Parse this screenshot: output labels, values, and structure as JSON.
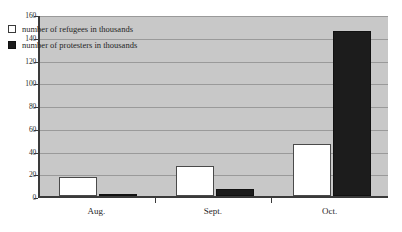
{
  "chart_data": {
    "type": "bar",
    "title": "",
    "subtitle": "",
    "xlabel": "",
    "ylabel": "",
    "categories": [
      "Aug.",
      "Sept.",
      "Oct."
    ],
    "series": [
      {
        "name": "number of refugees in thousands",
        "color": "#ffffff",
        "values": [
          17,
          26,
          46
        ]
      },
      {
        "name": "number of protesters in thousands",
        "color": "#1c1c1c",
        "values": [
          1,
          6,
          145
        ]
      }
    ],
    "ylim": [
      0,
      160
    ],
    "ytick_labels": [
      "0",
      "20",
      "40",
      "60",
      "80",
      "100",
      "120",
      "140",
      "160"
    ],
    "ytick_values": [
      0,
      20,
      40,
      60,
      80,
      100,
      120,
      140,
      160
    ],
    "grid": true,
    "legend_position": "upper-left-inside",
    "plot_background": "#c8c8c8",
    "axis_color": "#3a3a3a",
    "gridline_color": "#9a9a9a"
  }
}
